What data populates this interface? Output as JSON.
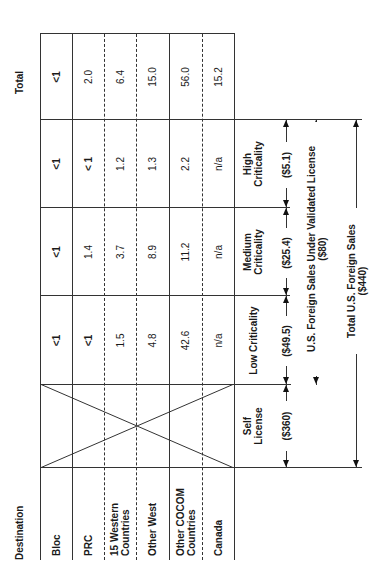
{
  "table": {
    "destination_header": "Destination",
    "total_header": "Total",
    "columns": [
      {
        "key": "self",
        "label_line1": "Self",
        "label_line2": "License",
        "amount": "($360)"
      },
      {
        "key": "low",
        "label_line1": "Low Criticality",
        "label_line2": "",
        "amount": "($49.5)"
      },
      {
        "key": "medium",
        "label_line1": "Medium",
        "label_line2": "Criticality",
        "amount": "($25.4)"
      },
      {
        "key": "high",
        "label_line1": "High",
        "label_line2": "Criticality",
        "amount": "($5.1)"
      }
    ],
    "rows": [
      {
        "destination_line1": "Bloc",
        "destination_line2": "",
        "low": "<1",
        "medium": "<1",
        "high": "<1",
        "total": "<1"
      },
      {
        "destination_line1": "PRC",
        "destination_line2": "",
        "low": "<1",
        "medium": "1.4",
        "high": "< 1",
        "total": "2.0"
      },
      {
        "destination_line1": "15 Western",
        "destination_line2": "Countries",
        "low": "1.5",
        "medium": "3.7",
        "high": "1.2",
        "total": "6.4"
      },
      {
        "destination_line1": "Other West",
        "destination_line2": "",
        "low": "4.8",
        "medium": "8.9",
        "high": "1.3",
        "total": "15.0"
      },
      {
        "destination_line1": "Other COCOM",
        "destination_line2": "Countries",
        "low": "42.6",
        "medium": "11.2",
        "high": "2.2",
        "total": "56.0"
      },
      {
        "destination_line1": "Canada",
        "destination_line2": "",
        "low": "n/a",
        "medium": "n/a",
        "high": "n/a",
        "total": "15.2"
      }
    ]
  },
  "annotations": {
    "validated_license_line1": "U.S. Foreign Sales Under Validated License",
    "validated_license_line2": "($80)",
    "total_sales_line1": "Total U.S. Foreign Sales",
    "total_sales_line2": "($440)"
  }
}
